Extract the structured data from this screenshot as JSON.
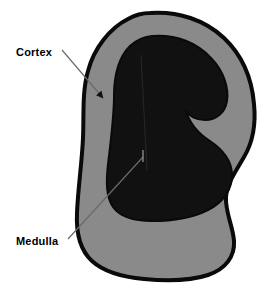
{
  "diagram": {
    "background_color": "#ffffff",
    "structures": [
      {
        "name": "cortex",
        "label": "Cortex",
        "color": "#8a8a8a",
        "description": "Outer gray band of the organ cross-section"
      },
      {
        "name": "medulla",
        "label": "Medulla",
        "color": "#111111",
        "description": "Inner dark region of the organ cross-section"
      }
    ],
    "outline_color": "#000000",
    "labels": [
      {
        "id": "cortex",
        "text": "Cortex",
        "x": 16,
        "y": 56,
        "leader": {
          "type": "arrow",
          "from_x": 62,
          "from_y": 50,
          "to_x": 106,
          "to_y": 101,
          "color": "#555555",
          "has_arrowhead": true
        }
      },
      {
        "id": "medulla",
        "text": "Medulla",
        "x": 16,
        "y": 245,
        "leader": {
          "type": "line",
          "from_x": 68,
          "from_y": 239,
          "to_x": 143,
          "to_y": 156,
          "color": "#555555",
          "has_arrowhead": false
        }
      }
    ]
  }
}
